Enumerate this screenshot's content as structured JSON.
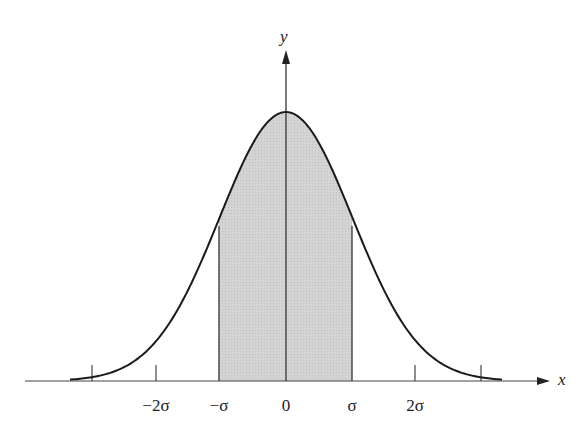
{
  "figure": {
    "type": "normal-distribution-curve",
    "axes": {
      "x_label": "x",
      "y_label": "y"
    },
    "ticks": [
      {
        "label": "",
        "pos": -3
      },
      {
        "label": "−2σ",
        "pos": -2
      },
      {
        "label": "−σ",
        "pos": -1
      },
      {
        "label": "0",
        "pos": 0
      },
      {
        "label": "σ",
        "pos": 1
      },
      {
        "label": "2σ",
        "pos": 2
      },
      {
        "label": "",
        "pos": 3
      }
    ],
    "shaded_region": {
      "from": "−σ",
      "to": "σ",
      "color": "#cfcfcf"
    },
    "colors": {
      "curve": "#1a1a1a",
      "axis": "#444444",
      "shade": "#cfcfcf"
    }
  },
  "labels": {
    "x_axis": "x",
    "y_axis": "y",
    "tick_minus_2sigma": "−2σ",
    "tick_minus_sigma": "−σ",
    "tick_zero": "0",
    "tick_sigma": "σ",
    "tick_2sigma": "2σ"
  }
}
